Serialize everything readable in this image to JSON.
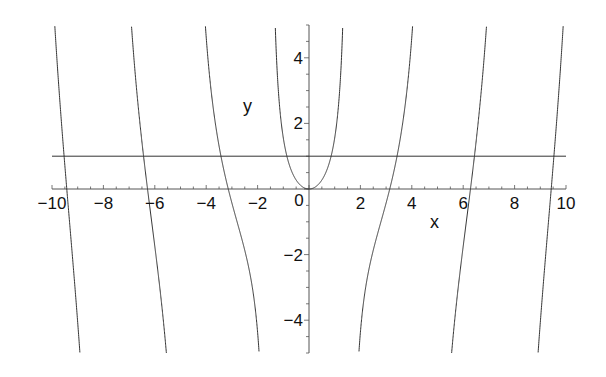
{
  "chart_data": {
    "type": "line",
    "title": "",
    "xlabel": "x",
    "ylabel": "y",
    "xlim": [
      -10,
      10
    ],
    "ylim": [
      -5,
      5
    ],
    "grid": false,
    "legend": null,
    "x_ticks": [
      -10,
      -8,
      -6,
      -4,
      -2,
      0,
      2,
      4,
      6,
      8,
      10
    ],
    "x_tick_labels": [
      "−10",
      "−8",
      "−6",
      "−4",
      "−2",
      "0",
      "2",
      "4",
      "6",
      "8",
      "10"
    ],
    "y_ticks": [
      -4,
      -2,
      2,
      4
    ],
    "y_tick_labels": [
      "−4",
      "−2",
      "2",
      "4"
    ],
    "series": [
      {
        "name": "y = x·tan(x)",
        "expression": "x*tan(x)",
        "color": "#333333"
      },
      {
        "name": "y = 1",
        "expression": "1",
        "color": "#333333"
      }
    ]
  },
  "colors": {
    "axis": "#555555",
    "curve": "#333333",
    "text": "#111111"
  }
}
